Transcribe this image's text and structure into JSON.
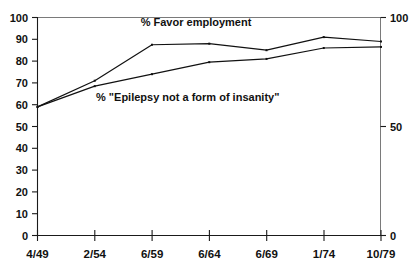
{
  "chart_data": {
    "type": "line",
    "title": "",
    "xlabel": "",
    "ylabel": "",
    "categories": [
      "4/49",
      "2/54",
      "6/59",
      "6/64",
      "6/69",
      "1/74",
      "10/79"
    ],
    "ylim": [
      0,
      100
    ],
    "y_ticks_left": [
      0,
      10,
      20,
      30,
      40,
      50,
      60,
      70,
      80,
      90,
      100
    ],
    "y_ticks_right": [
      0,
      50,
      100
    ],
    "grid": false,
    "legend_position": "inline-annotation",
    "series": [
      {
        "name": "% Favor employment",
        "values": [
          59,
          71,
          87.5,
          88,
          85,
          91,
          89
        ]
      },
      {
        "name": "% \"Epilepsy not a form of insanity\"",
        "values": [
          59,
          68.5,
          74,
          79.5,
          81,
          86,
          86.5
        ]
      }
    ],
    "annotations": [
      {
        "text": "% Favor employment",
        "x_category": "6/59",
        "value": 96
      },
      {
        "text": "% \"Epilepsy not a form of insanity\"",
        "x_category": "2/54",
        "value": 62
      }
    ]
  },
  "axes": {
    "left_labels": [
      "100",
      "90",
      "80",
      "70",
      "60",
      "50",
      "40",
      "30",
      "20",
      "10",
      "0"
    ],
    "right_labels": [
      "100",
      "50",
      "0"
    ],
    "x_labels": [
      "4/49",
      "2/54",
      "6/59",
      "6/64",
      "6/69",
      "1/74",
      "10/79"
    ]
  },
  "annotations": {
    "favor_employment": "% Favor employment",
    "not_insanity": "% \"Epilepsy not a form of insanity\""
  },
  "colors": {
    "line": "#111111",
    "axis": "#1a1a1a",
    "frame": "#7a7a7a",
    "background": "#ffffff"
  }
}
